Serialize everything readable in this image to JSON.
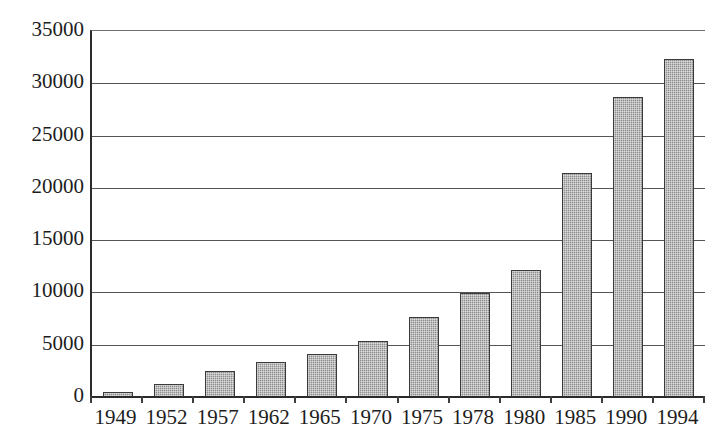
{
  "chart_data": {
    "type": "bar",
    "title": "",
    "subtitle": "",
    "xlabel": "",
    "ylabel": "",
    "categories": [
      "1949",
      "1952",
      "1957",
      "1962",
      "1965",
      "1970",
      "1975",
      "1978",
      "1980",
      "1985",
      "1990",
      "1994"
    ],
    "values": [
      480,
      1250,
      2500,
      3350,
      4100,
      5400,
      7650,
      9950,
      12100,
      21450,
      28650,
      32350
    ],
    "series": [
      {
        "name": "",
        "values": [
          480,
          1250,
          2500,
          3350,
          4100,
          5400,
          7650,
          9950,
          12100,
          21450,
          28650,
          32350
        ]
      }
    ],
    "ylim": [
      0,
      35000
    ],
    "ytick_labels": [
      "0",
      "5000",
      "10000",
      "15000",
      "20000",
      "25000",
      "30000",
      "35000"
    ],
    "ytick_values": [
      0,
      5000,
      10000,
      15000,
      20000,
      25000,
      30000,
      35000
    ],
    "grid": "horizontal",
    "legend": "none",
    "bar_fill_color": "#8e8e8e",
    "bar_border_color": "#3a3a3a",
    "axis_color": "#2b2b2b",
    "gridline_color": "#555555",
    "background_color": "#ffffff",
    "text_color": "#1d1d1d"
  }
}
